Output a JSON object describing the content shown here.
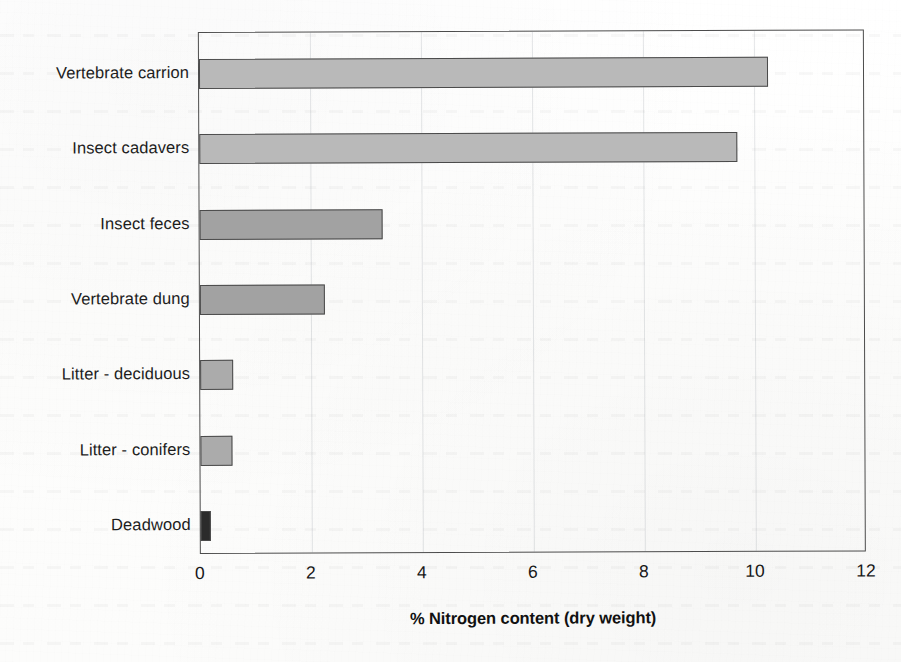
{
  "chart_data": {
    "type": "bar",
    "orientation": "horizontal",
    "title": "",
    "xlabel": "% Nitrogen content (dry weight)",
    "ylabel": "",
    "xlim": [
      0,
      12
    ],
    "xticks": [
      "0",
      "2",
      "4",
      "6",
      "8",
      "10",
      "12"
    ],
    "grid": "faint vertical gridlines at x ticks",
    "legend": "none",
    "categories": [
      "Vertebrate carrion",
      "Insect cadavers",
      "Insect feces",
      "Vertebrate dung",
      "Litter - deciduous",
      "Litter - conifers",
      "Deadwood"
    ],
    "values": [
      10.25,
      9.7,
      3.3,
      2.25,
      0.6,
      0.58,
      0.18
    ],
    "bar_colors": [
      "#b9b9b9",
      "#b9b9b9",
      "#a2a2a2",
      "#a2a2a2",
      "#ababab",
      "#ababab",
      "#2b2b2b"
    ],
    "bar_border_color": "#4a4a4a",
    "axis_color": "#4c4c4c"
  },
  "axis": {
    "title": "% Nitrogen content (dry weight)"
  }
}
